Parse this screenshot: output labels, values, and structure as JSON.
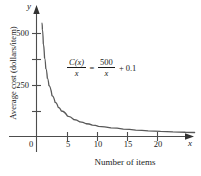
{
  "chart_data": {
    "type": "line",
    "title": "",
    "xlabel": "Number of items",
    "ylabel": "Average cost (dollars/item)",
    "xlim": [
      -1.2,
      26
    ],
    "ylim": [
      0,
      640
    ],
    "grid": false,
    "legend": null,
    "equation_display": "C(x)/x = 500/x + 0.1",
    "equation_parts": {
      "lhs_numerator": "C(x)",
      "lhs_denominator": "x",
      "equals": "=",
      "rhs_numerator": "500",
      "rhs_denominator": "x",
      "plus": "+",
      "constant": "0.1"
    },
    "x_ticks": [
      {
        "value": 0,
        "label": "0"
      },
      {
        "value": 5,
        "label": "5"
      },
      {
        "value": 10,
        "label": "10"
      },
      {
        "value": 15,
        "label": "15"
      },
      {
        "value": 20,
        "label": "20"
      }
    ],
    "y_ticks": [
      {
        "value": 125,
        "label": ""
      },
      {
        "value": 250,
        "label": "250"
      },
      {
        "value": 375,
        "label": ""
      },
      {
        "value": 500,
        "label": "500"
      }
    ],
    "axis_variable_x": "x",
    "axis_variable_y": "y",
    "series": [
      {
        "name": "C(x)/x",
        "x": [
          0.95,
          1.1,
          1.3,
          1.5,
          1.75,
          2,
          2.5,
          3,
          3.5,
          4,
          5,
          6,
          7,
          8,
          9,
          10,
          12,
          14,
          16,
          18,
          20,
          22,
          24,
          25.5
        ],
        "y": [
          526.4,
          454.6,
          384.7,
          333.4,
          285.8,
          250.1,
          200.1,
          166.8,
          142.9,
          125.1,
          100.1,
          83.4,
          71.5,
          62.6,
          55.7,
          50.1,
          41.8,
          35.8,
          31.4,
          27.9,
          25.1,
          22.8,
          20.9,
          19.7
        ]
      }
    ],
    "colors": {
      "curve": "#595959",
      "axis": "#4d4d4d",
      "text": "#1a1a1a",
      "background": "#ffffff"
    }
  }
}
